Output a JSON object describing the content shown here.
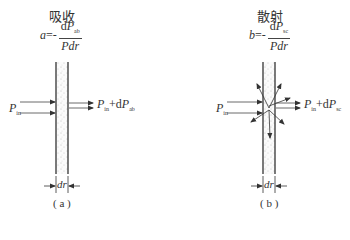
{
  "panels": [
    {
      "id": "a",
      "title": "吸收",
      "coef_symbol": "a",
      "eq": "=-",
      "numerator_d": "d",
      "numerator_P": "P",
      "numerator_sub": "ab",
      "denominator": "Pdr",
      "input_P": "P",
      "input_sub": "in",
      "output_P": "P",
      "output_sub": "in",
      "output_plus_d": "+d",
      "output_P2": "P",
      "output_sub2": "ab",
      "thickness_label": "dr",
      "caption": "( a )"
    },
    {
      "id": "b",
      "title": "散射",
      "coef_symbol": "b",
      "eq": "=-",
      "numerator_d": "d",
      "numerator_P": "P",
      "numerator_sub": "sc",
      "denominator": "Pdr",
      "input_P": "P",
      "input_sub": "in",
      "output_P": "P",
      "output_sub": "in",
      "output_plus_d": "+d",
      "output_P2": "P",
      "output_sub2": "sc",
      "thickness_label": "dr",
      "caption": "( b )"
    }
  ]
}
